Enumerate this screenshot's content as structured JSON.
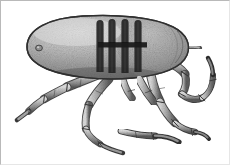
{
  "figure": {
    "kind": "scientific-illustration",
    "subject_label": "tick",
    "rendering_style": "grayscale stipple halftone engraving",
    "background_color": "#ffffff",
    "border_color": "#b9b9b9",
    "ink_color": "#2b2b2b",
    "body_fill_light": "#cfcfcf",
    "body_fill_mid": "#9a9a9a",
    "body_fill_dark": "#6d6d6d",
    "marking_color": "#1f1f1f",
    "canvas": {
      "width": 230,
      "height": 165
    },
    "parts": {
      "body_label": "idiosoma",
      "eye_label": "eye-spot",
      "scutum_label": "dorsal-shield-markings",
      "stripe_count": 4,
      "crossbar_label": "horizontal-bar-marking",
      "leg_count": 6,
      "claw_label": "hooked-claw"
    }
  }
}
